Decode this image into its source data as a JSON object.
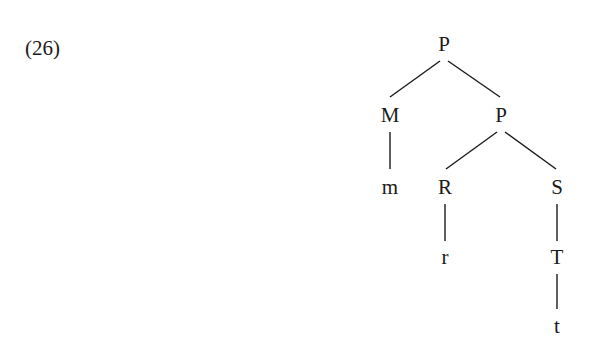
{
  "example": {
    "number": "(26)"
  },
  "tree": {
    "nodes": [
      {
        "id": "root_P",
        "label": "P",
        "x": 444,
        "y": 44
      },
      {
        "id": "M",
        "label": "M",
        "x": 390,
        "y": 115
      },
      {
        "id": "mid_P",
        "label": "P",
        "x": 501,
        "y": 115
      },
      {
        "id": "m",
        "label": "m",
        "x": 390,
        "y": 187
      },
      {
        "id": "R",
        "label": "R",
        "x": 445,
        "y": 187
      },
      {
        "id": "S",
        "label": "S",
        "x": 557,
        "y": 187
      },
      {
        "id": "r",
        "label": "r",
        "x": 445,
        "y": 257
      },
      {
        "id": "T",
        "label": "T",
        "x": 557,
        "y": 257
      },
      {
        "id": "t",
        "label": "t",
        "x": 557,
        "y": 326
      }
    ],
    "edges": [
      {
        "from": "root_P",
        "to": "M"
      },
      {
        "from": "root_P",
        "to": "mid_P"
      },
      {
        "from": "M",
        "to": "m"
      },
      {
        "from": "mid_P",
        "to": "R"
      },
      {
        "from": "mid_P",
        "to": "S"
      },
      {
        "from": "R",
        "to": "r"
      },
      {
        "from": "S",
        "to": "T"
      },
      {
        "from": "T",
        "to": "t"
      }
    ]
  }
}
